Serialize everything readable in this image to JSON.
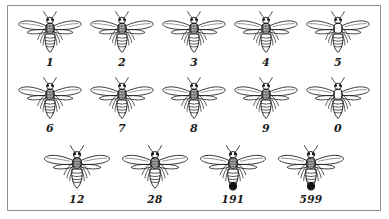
{
  "figure": {
    "title": "",
    "border_color": "#8e8e8e",
    "background_color": "#ffffff",
    "ink_color": "#1c1c1c"
  },
  "rows": [
    {
      "row_name": "row-1",
      "bees": [
        {
          "label": "1",
          "thorax": "striped",
          "abdomen_tip": "plain"
        },
        {
          "label": "2",
          "thorax": "striped",
          "abdomen_tip": "plain"
        },
        {
          "label": "3",
          "thorax": "striped",
          "abdomen_tip": "plain"
        },
        {
          "label": "4",
          "thorax": "striped",
          "abdomen_tip": "plain"
        },
        {
          "label": "5",
          "thorax": "dark",
          "abdomen_tip": "plain"
        }
      ]
    },
    {
      "row_name": "row-2",
      "bees": [
        {
          "label": "6",
          "thorax": "striped",
          "abdomen_tip": "plain"
        },
        {
          "label": "7",
          "thorax": "striped",
          "abdomen_tip": "plain"
        },
        {
          "label": "8",
          "thorax": "striped",
          "abdomen_tip": "plain"
        },
        {
          "label": "9",
          "thorax": "striped",
          "abdomen_tip": "plain"
        },
        {
          "label": "0",
          "thorax": "dark",
          "abdomen_tip": "plain"
        }
      ]
    },
    {
      "row_name": "row-3",
      "bees": [
        {
          "label": "12",
          "thorax": "striped",
          "abdomen_tip": "plain"
        },
        {
          "label": "28",
          "thorax": "striped",
          "abdomen_tip": "plain"
        },
        {
          "label": "191",
          "thorax": "striped",
          "abdomen_tip": "dark-spot"
        },
        {
          "label": "599",
          "thorax": "striped",
          "abdomen_tip": "dark-spot"
        }
      ]
    }
  ]
}
